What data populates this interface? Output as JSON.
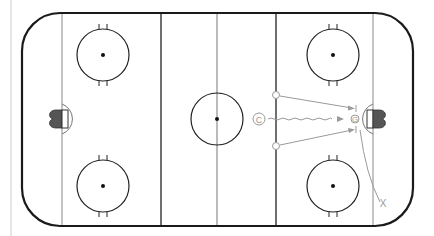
{
  "diagram": {
    "type": "hockey-rink-drill",
    "colors": {
      "boards": "#1a1a1a",
      "lines": "#333333",
      "center_line": "#666666",
      "goal_line": "#888888",
      "drill_path": "#9a9a9a",
      "goal_fill": "#555555"
    },
    "players": [
      {
        "id": "coach",
        "symbol": "C",
        "label": "coach-marker",
        "x": 259,
        "y": 119
      },
      {
        "id": "p1",
        "symbol": "O",
        "label": "player-top",
        "x": 276,
        "y": 95
      },
      {
        "id": "p2",
        "symbol": "O",
        "label": "player-bottom",
        "x": 276,
        "y": 146
      },
      {
        "id": "goalie",
        "symbol": "G",
        "label": "goalie",
        "x": 356,
        "y": 119
      },
      {
        "id": "x1",
        "symbol": "X",
        "label": "defender-x",
        "x": 382,
        "y": 207
      }
    ],
    "labels": {
      "coach": "C",
      "goalie": "G",
      "defender": "X"
    }
  }
}
